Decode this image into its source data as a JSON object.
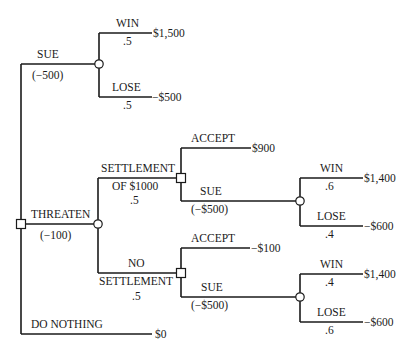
{
  "diagram": {
    "type": "decision-tree",
    "root": {
      "id": "root",
      "kind": "decision",
      "children": [
        {
          "id": "sue",
          "label": "SUE",
          "cost": "(−500)",
          "kind": "chance",
          "outcomes": [
            {
              "label": "WIN",
              "prob": ".5",
              "value": "$1,500"
            },
            {
              "label": "LOSE",
              "prob": ".5",
              "value": "−$500"
            }
          ]
        },
        {
          "id": "threaten",
          "label": "THREATEN",
          "cost": "(−100)",
          "kind": "chance",
          "outcomes": [
            {
              "id": "settlement",
              "label_line1": "SETTLEMENT",
              "label_line2": "OF $1000",
              "prob": ".5",
              "kind": "decision",
              "choices": [
                {
                  "label": "ACCEPT",
                  "value": "$900"
                },
                {
                  "label": "SUE",
                  "cost": "(−$500)",
                  "kind": "chance",
                  "outcomes": [
                    {
                      "label": "WIN",
                      "prob": ".6",
                      "value": "$1,400"
                    },
                    {
                      "label": "LOSE",
                      "prob": ".4",
                      "value": "−$600"
                    }
                  ]
                }
              ]
            },
            {
              "id": "no-settlement",
              "label_line1": "NO",
              "label_line2": "SETTLEMENT",
              "prob": ".5",
              "kind": "decision",
              "choices": [
                {
                  "label": "ACCEPT",
                  "value": "−$100"
                },
                {
                  "label": "SUE",
                  "cost": "(−$500)",
                  "kind": "chance",
                  "outcomes": [
                    {
                      "label": "WIN",
                      "prob": ".4",
                      "value": "$1,400"
                    },
                    {
                      "label": "LOSE",
                      "prob": ".6",
                      "value": "−$600"
                    }
                  ]
                }
              ]
            }
          ]
        },
        {
          "id": "do-nothing",
          "label": "DO NOTHING",
          "value": "$0"
        }
      ]
    }
  },
  "labels": {
    "sue": "SUE",
    "sue_cost": "(−500)",
    "sue_win": "WIN",
    "sue_win_prob": ".5",
    "sue_win_value": "$1,500",
    "sue_lose": "LOSE",
    "sue_lose_prob": ".5",
    "sue_lose_value": "−$500",
    "threaten": "THREATEN",
    "threaten_cost": "(−100)",
    "settle_l1": "SETTLEMENT",
    "settle_l2": "OF $1000",
    "settle_prob": ".5",
    "settle_accept": "ACCEPT",
    "settle_accept_value": "$900",
    "settle_sue": "SUE",
    "settle_sue_cost": "(−$500)",
    "settle_win": "WIN",
    "settle_win_prob": ".6",
    "settle_win_value": "$1,400",
    "settle_lose": "LOSE",
    "settle_lose_prob": ".4",
    "settle_lose_value": "−$600",
    "nosettle_l1": "NO",
    "nosettle_l2": "SETTLEMENT",
    "nosettle_prob": ".5",
    "nosettle_accept": "ACCEPT",
    "nosettle_accept_value": "−$100",
    "nosettle_sue": "SUE",
    "nosettle_sue_cost": "(−$500)",
    "nosettle_win": "WIN",
    "nosettle_win_prob": ".4",
    "nosettle_win_value": "$1,400",
    "nosettle_lose": "LOSE",
    "nosettle_lose_prob": ".6",
    "nosettle_lose_value": "−$600",
    "do_nothing": "DO NOTHING",
    "do_nothing_value": "$0"
  },
  "colors": {
    "line": "#1a1a1a",
    "background": "#ffffff"
  }
}
